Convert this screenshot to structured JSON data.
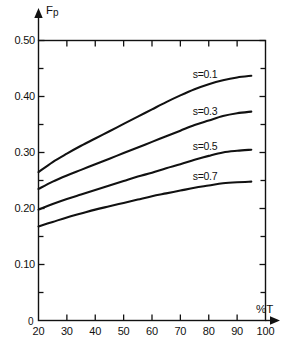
{
  "chart_data": {
    "type": "line",
    "title": "",
    "subtitle": "",
    "xlabel": "%T",
    "ylabel": "Fp",
    "xlim": [
      20,
      100
    ],
    "ylim": [
      0,
      0.5
    ],
    "grid": false,
    "legend_position": "inline-above-curve",
    "x_ticks": [
      20,
      30,
      40,
      50,
      60,
      70,
      80,
      90,
      100
    ],
    "x_tick_labels": [
      "20",
      "30",
      "40",
      "50",
      "60",
      "70",
      "80",
      "90",
      "100"
    ],
    "y_ticks": [
      0,
      0.1,
      0.2,
      0.3,
      0.4,
      0.5
    ],
    "y_tick_labels": [
      "0",
      "0.10",
      "0.20",
      "0.30",
      "0.40",
      "0.50"
    ],
    "y_minor_ticks": [
      0.05,
      0.15,
      0.25,
      0.35,
      0.45
    ],
    "origin_label": "0",
    "series": [
      {
        "name": "s=0.1",
        "label": "s=0.1",
        "x": [
          20,
          25,
          30,
          35,
          40,
          45,
          50,
          55,
          60,
          65,
          70,
          75,
          80,
          85,
          90,
          95
        ],
        "values": [
          0.265,
          0.283,
          0.298,
          0.312,
          0.325,
          0.338,
          0.351,
          0.364,
          0.377,
          0.39,
          0.402,
          0.413,
          0.422,
          0.429,
          0.434,
          0.437
        ]
      },
      {
        "name": "s=0.3",
        "label": "s=0.3",
        "x": [
          20,
          25,
          30,
          35,
          40,
          45,
          50,
          55,
          60,
          65,
          70,
          75,
          80,
          85,
          90,
          95
        ],
        "values": [
          0.235,
          0.248,
          0.259,
          0.269,
          0.279,
          0.289,
          0.299,
          0.309,
          0.319,
          0.329,
          0.339,
          0.349,
          0.357,
          0.365,
          0.37,
          0.373
        ]
      },
      {
        "name": "s=0.5",
        "label": "s=0.5",
        "x": [
          20,
          25,
          30,
          35,
          40,
          45,
          50,
          55,
          60,
          65,
          70,
          75,
          80,
          85,
          90,
          95
        ],
        "values": [
          0.198,
          0.208,
          0.217,
          0.225,
          0.233,
          0.241,
          0.249,
          0.257,
          0.264,
          0.272,
          0.279,
          0.287,
          0.294,
          0.3,
          0.303,
          0.305
        ]
      },
      {
        "name": "s=0.7",
        "label": "s=0.7",
        "x": [
          20,
          25,
          30,
          35,
          40,
          45,
          50,
          55,
          60,
          65,
          70,
          75,
          80,
          85,
          90,
          95
        ],
        "values": [
          0.168,
          0.176,
          0.184,
          0.191,
          0.198,
          0.204,
          0.21,
          0.216,
          0.222,
          0.227,
          0.232,
          0.237,
          0.241,
          0.245,
          0.247,
          0.248
        ]
      }
    ],
    "colors": {
      "axis": "#111111",
      "curve": "#111111",
      "background": "#ffffff"
    }
  },
  "axes": {
    "y_axis_name": "F",
    "y_axis_name_sub": "p",
    "x_axis_name": "%T"
  }
}
